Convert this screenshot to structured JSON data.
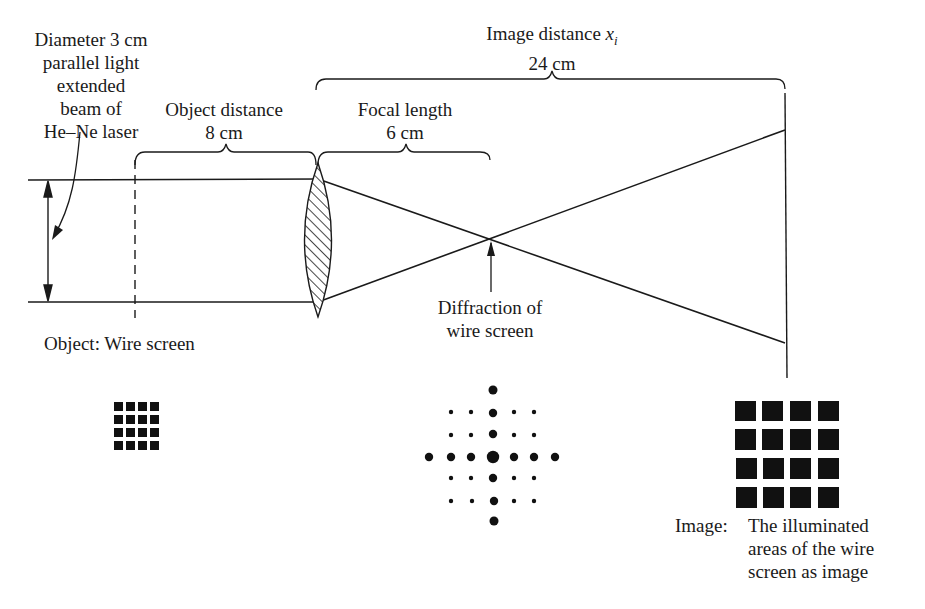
{
  "diagram": {
    "labels": {
      "beam_line1": "Diameter 3 cm",
      "beam_line2": "parallel light",
      "beam_line3": "extended",
      "beam_line4": "beam of",
      "beam_line5": "He–Ne laser",
      "object_distance_title": "Object distance",
      "object_distance_value": "8 cm",
      "focal_length_title": "Focal length",
      "focal_length_value": "6 cm",
      "image_distance_title": "Image distance ",
      "image_distance_var": "x",
      "image_distance_sub": "i",
      "image_distance_value": "24 cm",
      "diffraction_line1": "Diffraction of",
      "diffraction_line2": "wire screen",
      "object_label": "Object:  Wire screen",
      "image_prefix": "Image:",
      "image_line1": "The illuminated",
      "image_line2": "areas of the wire",
      "image_line3": "screen as image"
    },
    "measurements": {
      "beam_diameter_cm": 3,
      "object_distance_cm": 8,
      "focal_length_cm": 6,
      "image_distance_cm": 24
    },
    "patterns": {
      "object_grid": {
        "rows": 4,
        "cols": 4
      },
      "image_grid": {
        "rows": 4,
        "cols": 4
      },
      "diffraction_pattern": "cross-shaped dot array (7 x 7 with corners missing)"
    },
    "colors": {
      "ink": "#1a1a1a",
      "background": "#ffffff"
    }
  }
}
